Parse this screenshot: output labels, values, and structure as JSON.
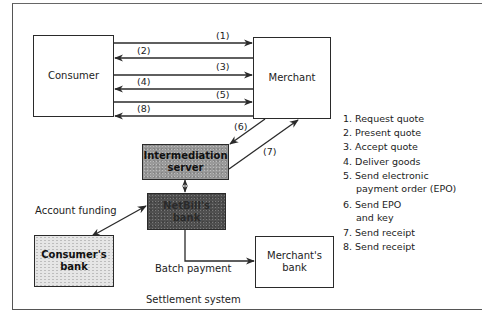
{
  "nodes": {
    "consumer": "Consumer",
    "merchant": "Merchant",
    "intermediation_server": [
      "Intermediation",
      "server"
    ],
    "netbill_bank": [
      "NetBill's",
      "bank"
    ],
    "consumers_bank": [
      "Consumer's",
      "bank"
    ],
    "merchants_bank": [
      "Merchant's",
      "bank"
    ]
  },
  "arrow_labels": {
    "a1": "(1)",
    "a2": "(2)",
    "a3": "(3)",
    "a4": "(4)",
    "a5": "(5)",
    "a8": "(8)",
    "a6": "(6)",
    "a7": "(7)"
  },
  "edge_labels": {
    "account_funding": "Account funding",
    "batch_payment": "Batch payment",
    "settlement_system": "Settlement system"
  },
  "legend": [
    {
      "text": "1. Request quote"
    },
    {
      "text": "2. Present quote"
    },
    {
      "text": "3. Accept quote"
    },
    {
      "text": "4. Deliver goods"
    },
    {
      "text": "5. Send electronic",
      "cont": "payment order (EPO)"
    },
    {
      "text": "6. Send EPO",
      "cont": "and key"
    },
    {
      "text": "7. Send receipt"
    },
    {
      "text": "8. Send receipt"
    }
  ],
  "colors": {
    "line": "#2a2a2a",
    "server_fill": "#9a9a9a",
    "netbill_fill": "#505050",
    "consumers_bank_fill": "#e6e6e6"
  }
}
